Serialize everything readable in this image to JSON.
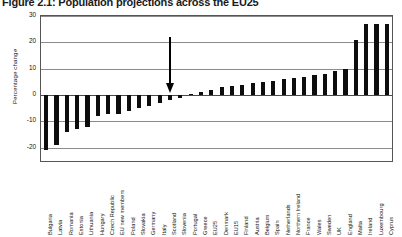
{
  "figure": {
    "title": "Figure 2.1: Population projections across the EU25"
  },
  "chart_data": {
    "type": "bar",
    "title": "Figure 2.1: Population projections across the EU25",
    "xlabel": "",
    "ylabel": "Percentage change",
    "ylim": [
      -25,
      30
    ],
    "yticks": [
      30,
      20,
      10,
      0,
      -10,
      -20
    ],
    "ytick_labels": [
      "30",
      "20",
      "10",
      "0",
      "-10",
      "-20"
    ],
    "grid": true,
    "legend": "none",
    "bar_color": "#0d0d0d",
    "annotations": [
      {
        "type": "arrow",
        "target": "Scotland",
        "direction": "down",
        "label": ""
      }
    ],
    "categories": [
      "Bulgaria",
      "Latvia",
      "Romania",
      "Estonia",
      "Lithuania",
      "Hungary",
      "Czech Republic",
      "EU new members",
      "Poland",
      "Slovakia",
      "Germany",
      "Italy",
      "Scotland",
      "Slovenia",
      "Portugal",
      "Greece",
      "EU25",
      "Denmark",
      "EU15",
      "Finland",
      "Austria",
      "Belgium",
      "Spain",
      "Netherlands",
      "Northern Ireland",
      "France",
      "Wales",
      "Sweden",
      "UK",
      "England",
      "Malta",
      "Ireland",
      "Luxembourg",
      "Cyprus"
    ],
    "values": [
      -21,
      -19,
      -14,
      -13,
      -12,
      -8,
      -7,
      -7,
      -6,
      -5,
      -4,
      -3,
      -2,
      -1,
      0.5,
      1,
      2,
      3,
      3.5,
      4,
      4.5,
      5,
      5.5,
      6,
      6.5,
      7,
      7.5,
      8,
      9,
      10,
      21,
      27,
      27,
      27
    ]
  }
}
